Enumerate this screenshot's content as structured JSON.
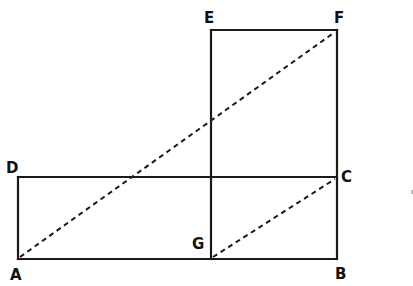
{
  "diagram": {
    "type": "geometric-construction",
    "points": {
      "A": {
        "label": "A",
        "x": 18,
        "y": 259
      },
      "B": {
        "label": "B",
        "x": 337,
        "y": 259
      },
      "C": {
        "label": "C",
        "x": 337,
        "y": 177
      },
      "D": {
        "label": "D",
        "x": 18,
        "y": 177
      },
      "E": {
        "label": "E",
        "x": 211,
        "y": 30
      },
      "F": {
        "label": "F",
        "x": 337,
        "y": 30
      },
      "G": {
        "label": "G",
        "x": 211,
        "y": 259
      }
    },
    "solid_segments": [
      [
        "A",
        "B"
      ],
      [
        "D",
        "C"
      ],
      [
        "A",
        "D"
      ],
      [
        "E",
        "F"
      ],
      [
        "E",
        "G"
      ],
      [
        "F",
        "B"
      ]
    ],
    "dashed_segments": [
      [
        "A",
        "F"
      ],
      [
        "G",
        "C"
      ]
    ],
    "labels": {
      "A": "A",
      "B": "B",
      "C": "C",
      "D": "D",
      "E": "E",
      "F": "F",
      "G": "G"
    }
  }
}
